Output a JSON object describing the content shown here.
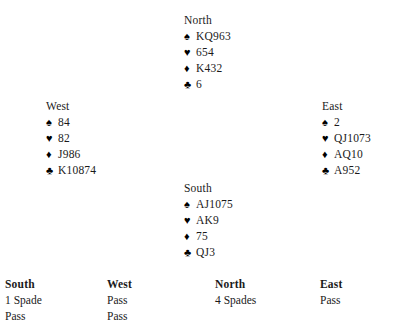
{
  "suit_symbols": {
    "spade": "♠",
    "heart": "♥",
    "diamond": "♦",
    "club": "♣"
  },
  "hands": {
    "north": {
      "label": "North",
      "spades": "KQ963",
      "hearts": "654",
      "diamonds": "K432",
      "clubs": "6"
    },
    "west": {
      "label": "West",
      "spades": "84",
      "hearts": "82",
      "diamonds": "J986",
      "clubs": "K10874"
    },
    "east": {
      "label": "East",
      "spades": "2",
      "hearts": "QJ1073",
      "diamonds": "AQ10",
      "clubs": "A952"
    },
    "south": {
      "label": "South",
      "spades": "AJ1075",
      "hearts": "AK9",
      "diamonds": "75",
      "clubs": "QJ3"
    }
  },
  "auction": {
    "headers": {
      "south": "South",
      "west": "West",
      "north": "North",
      "east": "East"
    },
    "rows": [
      {
        "south": "1 Spade",
        "west": "Pass",
        "north": "4 Spades",
        "east": "Pass"
      },
      {
        "south": "Pass",
        "west": "Pass",
        "north": "",
        "east": ""
      }
    ]
  }
}
